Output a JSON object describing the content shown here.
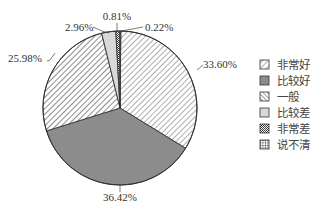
{
  "chart_data": {
    "type": "pie",
    "title": "",
    "start": "top",
    "direction": "clockwise",
    "legend_position": "right",
    "slices": [
      {
        "label": "非常好",
        "value": 33.6,
        "display": "33.60%",
        "fill": "hatch-back",
        "color": "#ffffff"
      },
      {
        "label": "比较好",
        "value": 36.42,
        "display": "36.42%",
        "fill": "solid",
        "color": "#8c8c8c"
      },
      {
        "label": "一般",
        "value": 25.98,
        "display": "25.98%",
        "fill": "hatch-fwd",
        "color": "#ffffff"
      },
      {
        "label": "比较差",
        "value": 2.96,
        "display": "2.96%",
        "fill": "solid",
        "color": "#d9d9d9"
      },
      {
        "label": "非常差",
        "value": 0.81,
        "display": "0.81%",
        "fill": "checker",
        "color": "#ffffff"
      },
      {
        "label": "说不清",
        "value": 0.22,
        "display": "0.22%",
        "fill": "grid",
        "color": "#ffffff"
      }
    ]
  }
}
